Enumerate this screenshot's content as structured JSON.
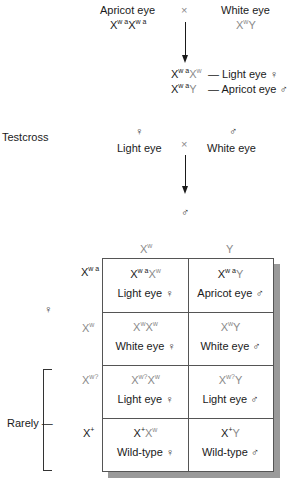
{
  "cross1": {
    "female_label": "Apricot eye",
    "female_genotype": {
      "a": "X",
      "a_sup": "w",
      "a_sup2": "a",
      "b": "X",
      "b_sup": "w",
      "b_sup2": "a"
    },
    "cross_symbol": "×",
    "male_label": "White eye",
    "male_genotype": {
      "a": "X",
      "a_sup": "w",
      "b": "Y"
    },
    "offspring": [
      {
        "g1": "X",
        "g1_sup": "w",
        "g1_sup2": "a",
        "g2": "X",
        "g2_sup": "w",
        "phenotype": "— Light eye ♀"
      },
      {
        "g1": "X",
        "g1_sup": "w",
        "g1_sup2": "a",
        "g2": "Y",
        "g2_sup": "",
        "phenotype": "— Apricot eye ♂"
      }
    ]
  },
  "testcross": {
    "title": "Testcross",
    "female_symbol": "♀",
    "female_label": "Light eye",
    "cross_symbol": "×",
    "male_symbol": "♂",
    "male_label": "White eye",
    "result_symbol": "♂"
  },
  "punnett": {
    "col_headers": [
      {
        "base": "X",
        "sup": "w"
      },
      {
        "base": "Y",
        "sup": ""
      }
    ],
    "row_side_label": "♀",
    "row_headers": [
      {
        "base": "X",
        "sup": "wa"
      },
      {
        "base": "X",
        "sup": "w"
      },
      {
        "base": "X",
        "sup": "w?"
      },
      {
        "base": "X",
        "sup": "+"
      }
    ],
    "rarely_label": "Rarely —",
    "cells": [
      [
        {
          "genotype": "Xʷᵃ Xʷ",
          "phenotype": "Light eye ♀"
        },
        {
          "genotype": "Xʷᵃ Y",
          "phenotype": "Apricot eye ♂"
        }
      ],
      [
        {
          "genotype": "Xʷ Xʷ",
          "phenotype": "White eye ♀"
        },
        {
          "genotype": "XʷY",
          "phenotype": "White eye ♂"
        }
      ],
      [
        {
          "genotype": "Xʷ? Xʷ",
          "phenotype": "Light eye ♀"
        },
        {
          "genotype": "Xʷ?Y",
          "phenotype": "Light eye ♂"
        }
      ],
      [
        {
          "genotype": "X⁺Xʷ",
          "phenotype": "Wild-type ♀"
        },
        {
          "genotype": "X⁺Y",
          "phenotype": "Wild-type ♂"
        }
      ]
    ]
  }
}
